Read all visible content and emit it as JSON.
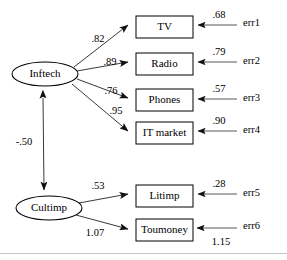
{
  "diagram": {
    "latent_variables": [
      {
        "id": "inftech",
        "label": "Inftech",
        "cx": 45,
        "cy": 74,
        "rx": 33,
        "ry": 12
      },
      {
        "id": "cultimp",
        "label": "Cultimp",
        "cx": 49,
        "cy": 208,
        "rx": 33,
        "ry": 12
      }
    ],
    "observed_variables": [
      {
        "id": "tv",
        "label": "TV",
        "x": 136,
        "y": 16,
        "w": 57,
        "h": 22
      },
      {
        "id": "radio",
        "label": "Radio",
        "x": 136,
        "y": 53,
        "w": 57,
        "h": 22
      },
      {
        "id": "phones",
        "label": "Phones",
        "x": 136,
        "y": 89,
        "w": 57,
        "h": 22
      },
      {
        "id": "it_market",
        "label": "IT market",
        "x": 136,
        "y": 122,
        "w": 57,
        "h": 22
      },
      {
        "id": "litimp",
        "label": "Litimp",
        "x": 136,
        "y": 185,
        "w": 57,
        "h": 22
      },
      {
        "id": "toumoney",
        "label": "Toumoney",
        "x": 136,
        "y": 219,
        "w": 57,
        "h": 22
      }
    ],
    "error_terms": [
      {
        "id": "err1",
        "label": "err1",
        "x": 243,
        "y": 24,
        "value": ".68",
        "value_x": 219,
        "value_y": 16,
        "target": "tv"
      },
      {
        "id": "err2",
        "label": "err2",
        "x": 243,
        "y": 62,
        "value": ".79",
        "value_x": 219,
        "value_y": 53,
        "target": "radio"
      },
      {
        "id": "err3",
        "label": "err3",
        "x": 243,
        "y": 99,
        "value": ".57",
        "value_x": 219,
        "value_y": 90,
        "target": "phones"
      },
      {
        "id": "err4",
        "label": "err4",
        "x": 243,
        "y": 131,
        "value": ".90",
        "value_x": 219,
        "value_y": 122,
        "target": "it_market"
      },
      {
        "id": "err5",
        "label": "err5",
        "x": 243,
        "y": 194,
        "value": ".28",
        "value_x": 219,
        "value_y": 185,
        "target": "litimp"
      },
      {
        "id": "err6",
        "label": "err6",
        "x": 243,
        "y": 227,
        "value": "1.15",
        "value_x": 221,
        "value_y": 243,
        "target": "toumoney"
      }
    ],
    "loadings": [
      {
        "id": "inftech-tv",
        "from": "Inftech",
        "to": "TV",
        "value": ".82",
        "label_x": 98,
        "label_y": 40
      },
      {
        "id": "inftech-radio",
        "from": "Inftech",
        "to": "Radio",
        "value": ".89",
        "label_x": 110,
        "label_y": 63
      },
      {
        "id": "inftech-phones",
        "from": "Inftech",
        "to": "Phones",
        "value": ".76",
        "label_x": 111,
        "label_y": 92
      },
      {
        "id": "inftech-it-market",
        "from": "Inftech",
        "to": "IT market",
        "value": ".95",
        "label_x": 116,
        "label_y": 112
      },
      {
        "id": "cultimp-litimp",
        "from": "Cultimp",
        "to": "Litimp",
        "value": ".53",
        "label_x": 98,
        "label_y": 187
      },
      {
        "id": "cultimp-toumoney",
        "from": "Cultimp",
        "to": "Toumoney",
        "value": "1.07",
        "label_x": 95,
        "label_y": 234
      }
    ],
    "covariance": {
      "id": "inftech-cultimp-covariance",
      "from": "Inftech",
      "to": "Cultimp",
      "value": "-.50",
      "label_x": 24,
      "label_y": 143,
      "bidirectional": true
    }
  }
}
